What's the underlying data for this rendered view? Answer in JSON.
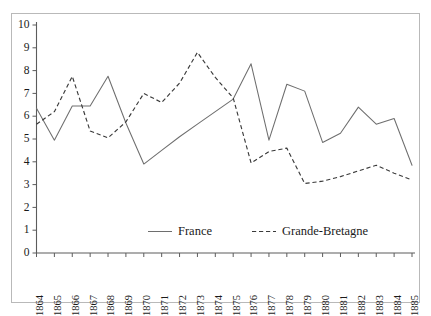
{
  "chart_data": {
    "type": "line",
    "title": "",
    "subtitle": "",
    "xlabel": "",
    "ylabel": "",
    "x": [
      1864,
      1865,
      1866,
      1867,
      1868,
      1869,
      1870,
      1871,
      1872,
      1873,
      1874,
      1875,
      1876,
      1877,
      1878,
      1879,
      1880,
      1881,
      1882,
      1883,
      1884,
      1885
    ],
    "categories": [
      "1864",
      "1865",
      "1866",
      "1867",
      "1868",
      "1869",
      "1870",
      "1871",
      "1872",
      "1873",
      "1874",
      "1875",
      "1876",
      "1877",
      "1878",
      "1879",
      "1880",
      "1881",
      "1882",
      "1883",
      "1884",
      "1885"
    ],
    "series": [
      {
        "name": "France",
        "style": "solid",
        "color": "#6e6e6e",
        "values": [
          6.35,
          4.95,
          6.45,
          6.45,
          7.75,
          5.7,
          3.9,
          4.5,
          5.1,
          5.65,
          6.2,
          6.75,
          8.3,
          4.95,
          7.4,
          7.1,
          4.85,
          5.25,
          6.4,
          5.65,
          5.9,
          3.85
        ]
      },
      {
        "name": "Grande-Bretagne",
        "style": "dashed",
        "color": "#3a3a3a",
        "values": [
          5.65,
          6.2,
          7.75,
          5.35,
          5.05,
          5.75,
          7.0,
          6.6,
          7.45,
          8.8,
          7.7,
          6.8,
          3.95,
          4.45,
          4.6,
          3.05,
          3.15,
          3.35,
          3.6,
          3.85,
          3.5,
          3.2
        ]
      }
    ],
    "ylim": [
      0,
      10
    ],
    "yticks": [
      0,
      1,
      2,
      3,
      4,
      5,
      6,
      7,
      8,
      9,
      10
    ],
    "ytick_labels": [
      "0",
      "1",
      "2",
      "3",
      "4",
      "5",
      "6",
      "7",
      "8",
      "9",
      "10"
    ],
    "xlim": [
      1864,
      1885
    ],
    "grid": false,
    "legend_position": "inside-bottom-center",
    "legend": [
      "France",
      "Grande-Bretagne"
    ]
  },
  "frame": {
    "border_color": "#b9b9b9",
    "background": "#ffffff"
  },
  "axis": {
    "color": "#5c5c5c",
    "tick_color": "#5c5c5c"
  }
}
